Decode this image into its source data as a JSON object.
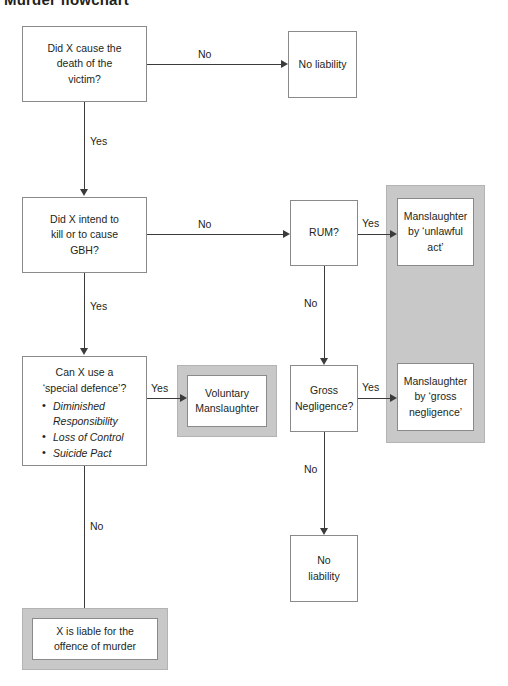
{
  "page": {
    "title": "Murder flowchart",
    "accent_shade": "#c8c8c8",
    "line_color": "#3b3b3b",
    "box_border": "#8a8a8a"
  },
  "nodes": {
    "q_cause_death": {
      "line1": "Did X cause the",
      "line2": "death of the",
      "line3": "victim?"
    },
    "no_liability_top": {
      "line1": "No liability"
    },
    "q_intend_kill": {
      "line1": "Did X intend to",
      "line2": "kill or to cause",
      "line3": "GBH?"
    },
    "q_rum": {
      "line1": "RUM?"
    },
    "outcome_unlawful_act": {
      "line1": "Manslaughter",
      "line2": "by ‘unlawful",
      "line3": "act’"
    },
    "q_special_defence": {
      "head1": "Can X use a",
      "head2": "‘special defence’?",
      "bullets": [
        "Diminished Responsibility",
        "Loss of Control",
        "Suicide Pact"
      ]
    },
    "outcome_voluntary": {
      "line1": "Voluntary",
      "line2": "Manslaughter"
    },
    "q_gross_negligence": {
      "line1": "Gross",
      "line2": "Negligence?"
    },
    "outcome_gross_negligence": {
      "line1": "Manslaughter",
      "line2": "by ‘gross",
      "line3": "negligence’"
    },
    "no_liability_bottom": {
      "line1": "No",
      "line2": "liability"
    },
    "outcome_murder": {
      "line1": "X is liable for the",
      "line2": "offence of murder"
    }
  },
  "edges": {
    "cause_no": "No",
    "cause_yes": "Yes",
    "intend_no": "No",
    "intend_yes": "Yes",
    "rum_yes": "Yes",
    "rum_no": "No",
    "defence_yes": "Yes",
    "defence_no": "No",
    "gross_yes": "Yes",
    "gross_no": "No"
  }
}
